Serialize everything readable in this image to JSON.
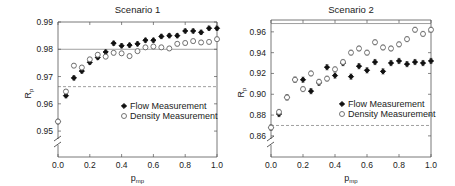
{
  "chart_data": [
    {
      "type": "scatter",
      "title": "Scenario 1",
      "xlabel": "p",
      "xlabel_sub": "mp",
      "ylabel": "R",
      "ylabel_sub": "p",
      "xlim": [
        0.0,
        1.0
      ],
      "ylim": [
        0.9405,
        0.99
      ],
      "y_axis_break": true,
      "xticks": [
        0.0,
        0.2,
        0.4,
        0.6,
        0.8,
        1.0
      ],
      "xtick_labels": [
        "0.0",
        "0.2",
        "0.4",
        "0.6",
        "0.8",
        "1.0"
      ],
      "yticks": [
        0.99,
        0.98,
        0.97,
        0.96,
        0.95
      ],
      "ytick_labels": [
        "0.99",
        "0.98",
        "0.97",
        "0.96",
        "0.95"
      ],
      "reference_lines": [
        {
          "style": "solid",
          "y": 0.98
        },
        {
          "style": "dashed",
          "y": 0.9663
        }
      ],
      "legend": {
        "position": "center-right",
        "entries": [
          "Flow Measurement",
          "Density Measurement"
        ]
      },
      "x": [
        0.0,
        0.05,
        0.1,
        0.15,
        0.2,
        0.25,
        0.3,
        0.35,
        0.4,
        0.45,
        0.5,
        0.55,
        0.6,
        0.65,
        0.7,
        0.75,
        0.8,
        0.85,
        0.9,
        0.95,
        1.0
      ],
      "series": [
        {
          "name": "Flow Measurement",
          "marker": "filled-diamond",
          "values": [
            0.9535,
            0.963,
            0.9695,
            0.972,
            0.9752,
            0.977,
            0.979,
            0.9822,
            0.9813,
            0.9815,
            0.982,
            0.9833,
            0.9833,
            0.9847,
            0.985,
            0.985,
            0.9867,
            0.9867,
            0.9862,
            0.9877,
            0.9877
          ],
          "error": 0.0008
        },
        {
          "name": "Density Measurement",
          "marker": "open-circle",
          "values": [
            0.9535,
            0.9645,
            0.974,
            0.9733,
            0.9763,
            0.978,
            0.9773,
            0.9787,
            0.9785,
            0.9775,
            0.9793,
            0.9807,
            0.981,
            0.9807,
            0.9803,
            0.982,
            0.9823,
            0.983,
            0.9825,
            0.9827,
            0.9837
          ],
          "error": 0.0008
        }
      ]
    },
    {
      "type": "scatter",
      "title": "Scenario 2",
      "xlabel": "p",
      "xlabel_sub": "mp",
      "ylabel": "R",
      "ylabel_sub": "p",
      "xlim": [
        0.0,
        1.0
      ],
      "ylim": [
        0.8397,
        0.9714
      ],
      "y_axis_break": true,
      "xticks": [
        0.0,
        0.2,
        0.4,
        0.6,
        0.8,
        1.0
      ],
      "xtick_labels": [
        "0.0",
        "0.2",
        "0.4",
        "0.6",
        "0.8",
        "1.0"
      ],
      "yticks": [
        0.96,
        0.94,
        0.92,
        0.9,
        0.88,
        0.86
      ],
      "ytick_labels": [
        "0.96",
        "0.94",
        "0.92",
        "0.90",
        "0.88",
        "0.86"
      ],
      "reference_lines": [
        {
          "style": "solid",
          "y": 0.968
        },
        {
          "style": "dashed",
          "y": 0.87
        }
      ],
      "legend": {
        "position": "center-right",
        "entries": [
          "Flow Measurement",
          "Density Measurement"
        ]
      },
      "x": [
        0.0,
        0.05,
        0.1,
        0.15,
        0.2,
        0.25,
        0.3,
        0.35,
        0.4,
        0.45,
        0.5,
        0.55,
        0.6,
        0.65,
        0.7,
        0.75,
        0.8,
        0.85,
        0.9,
        0.95,
        1.0
      ],
      "series": [
        {
          "name": "Flow Measurement",
          "marker": "filled-diamond",
          "values": [
            0.868,
            0.881,
            0.897,
            0.914,
            0.914,
            0.903,
            0.911,
            0.926,
            0.918,
            0.93,
            0.917,
            0.927,
            0.923,
            0.931,
            0.922,
            0.93,
            0.932,
            0.929,
            0.931,
            0.93,
            0.932
          ],
          "error": 0.0025
        },
        {
          "name": "Density Measurement",
          "marker": "open-circle",
          "values": [
            0.868,
            0.883,
            0.897,
            0.914,
            0.905,
            0.92,
            0.912,
            0.915,
            0.924,
            0.931,
            0.94,
            0.944,
            0.94,
            0.95,
            0.945,
            0.944,
            0.948,
            0.953,
            0.962,
            0.958,
            0.962
          ],
          "error": 0.0025
        }
      ]
    }
  ]
}
